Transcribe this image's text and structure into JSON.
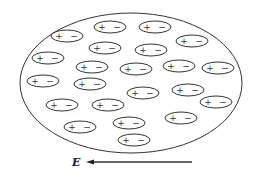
{
  "diagram": {
    "colors": {
      "stroke": "#333333",
      "background": "#ffffff"
    },
    "boundary": {
      "shape": "ellipse",
      "cx": 131,
      "cy": 83,
      "rx": 111,
      "ry": 70
    },
    "dipole_size": {
      "rx": 16,
      "ry": 6
    },
    "dipoles": [
      {
        "cx": 110,
        "cy": 27,
        "plus": "+",
        "minus": "−"
      },
      {
        "cx": 155,
        "cy": 27,
        "plus": "+",
        "minus": "−"
      },
      {
        "cx": 67,
        "cy": 36,
        "plus": "+",
        "minus": "−"
      },
      {
        "cx": 192,
        "cy": 41,
        "plus": "+",
        "minus": "−"
      },
      {
        "cx": 105,
        "cy": 48,
        "plus": "+",
        "minus": "−"
      },
      {
        "cx": 151,
        "cy": 50,
        "plus": "+",
        "minus": "−"
      },
      {
        "cx": 48,
        "cy": 58,
        "plus": "+",
        "minus": "−"
      },
      {
        "cx": 92,
        "cy": 67,
        "plus": "+",
        "minus": "−"
      },
      {
        "cx": 136,
        "cy": 69,
        "plus": "+",
        "minus": "−"
      },
      {
        "cx": 179,
        "cy": 66,
        "plus": "+",
        "minus": "−"
      },
      {
        "cx": 218,
        "cy": 68,
        "plus": "+",
        "minus": "−"
      },
      {
        "cx": 43,
        "cy": 81,
        "plus": "+",
        "minus": "−"
      },
      {
        "cx": 90,
        "cy": 84,
        "plus": "+",
        "minus": "−"
      },
      {
        "cx": 143,
        "cy": 93,
        "plus": "+",
        "minus": "−"
      },
      {
        "cx": 188,
        "cy": 90,
        "plus": "+",
        "minus": "−"
      },
      {
        "cx": 216,
        "cy": 102,
        "plus": "+",
        "minus": "−"
      },
      {
        "cx": 62,
        "cy": 105,
        "plus": "+",
        "minus": "−"
      },
      {
        "cx": 108,
        "cy": 105,
        "plus": "+",
        "minus": "−"
      },
      {
        "cx": 181,
        "cy": 118,
        "plus": "+",
        "minus": "−"
      },
      {
        "cx": 80,
        "cy": 127,
        "plus": "+",
        "minus": "−"
      },
      {
        "cx": 129,
        "cy": 123,
        "plus": "+",
        "minus": "−"
      },
      {
        "cx": 134,
        "cy": 140,
        "plus": "+",
        "minus": "−"
      }
    ],
    "field": {
      "label": "E",
      "direction": "left",
      "arrow": {
        "x1": 192,
        "x2": 86,
        "y": 162
      },
      "label_pos": {
        "x": 72,
        "y": 166
      }
    }
  }
}
